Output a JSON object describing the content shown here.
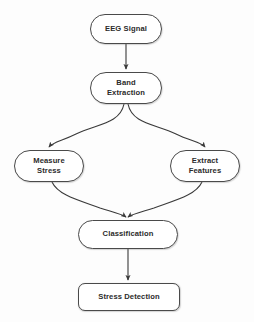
{
  "diagram": {
    "background_color": "#fdfdfd",
    "node_fill_color": "#ffffff",
    "node_stroke_color": "#4a4a4a",
    "text_color": "#2b2b2b",
    "edge_color": "#3a3a3a",
    "nodes": [
      {
        "id": "eeg-signal",
        "label": "EEG Signal",
        "shape": "stadium"
      },
      {
        "id": "band-extraction",
        "label": "Band\nExtraction",
        "shape": "stadium"
      },
      {
        "id": "measure-stress",
        "label": "Measure\nStress",
        "shape": "stadium"
      },
      {
        "id": "extract-features",
        "label": "Extract\nFeatures",
        "shape": "stadium"
      },
      {
        "id": "classification",
        "label": "Classification",
        "shape": "stadium"
      },
      {
        "id": "stress-detection",
        "label": "Stress Detection",
        "shape": "rounded-rect"
      }
    ],
    "edges": [
      {
        "from": "eeg-signal",
        "to": "band-extraction",
        "style": "straight",
        "arrow": true
      },
      {
        "from": "band-extraction",
        "to": "measure-stress",
        "style": "curved",
        "arrow": true
      },
      {
        "from": "band-extraction",
        "to": "extract-features",
        "style": "curved",
        "arrow": true
      },
      {
        "from": "measure-stress",
        "to": "classification",
        "style": "curved",
        "arrow": true
      },
      {
        "from": "extract-features",
        "to": "classification",
        "style": "curved",
        "arrow": true
      },
      {
        "from": "classification",
        "to": "stress-detection",
        "style": "straight",
        "arrow": true
      }
    ]
  }
}
